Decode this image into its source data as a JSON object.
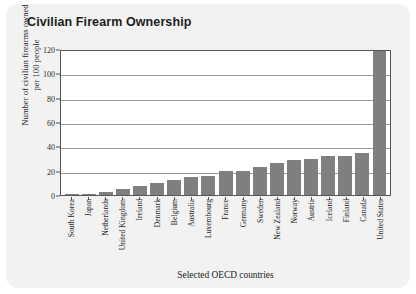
{
  "card": {
    "title": "Civilian Firearm Ownership",
    "background_color": "#f2f2f2",
    "plot_background_color": "#ffffff"
  },
  "chart_data": {
    "type": "bar",
    "title": "Civilian Firearm Ownership",
    "xlabel": "Selected OECD countries",
    "ylabel": "Number of civilian firearms owned per 100 people",
    "ylabel_line1": "Number of civilian firearms owned",
    "ylabel_line2": "per 100 people",
    "ylim": [
      0,
      120
    ],
    "yticks": [
      0,
      20,
      40,
      60,
      80,
      100,
      120
    ],
    "grid": true,
    "legend": "none",
    "bar_color": "#7f7f7f",
    "categories": [
      "South Korea",
      "Japan",
      "Netherlands",
      "United Kingdom",
      "Ireland",
      "Denmark",
      "Belgium",
      "Australia",
      "Luxembourg",
      "France",
      "Germany",
      "Sweden",
      "New Zealand",
      "Norway",
      "Austria",
      "Iceland",
      "Finland",
      "Canada",
      "United States"
    ],
    "values": [
      0.3,
      0.6,
      2.6,
      5,
      7.2,
      9.9,
      12.7,
      14.5,
      15.8,
      19.6,
      20,
      23.1,
      26.3,
      28.8,
      30,
      31.7,
      32.4,
      34.7,
      120
    ]
  }
}
